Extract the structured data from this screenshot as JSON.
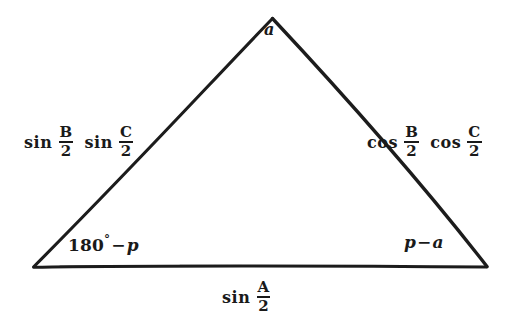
{
  "figure": {
    "type": "geometric-diagram",
    "shape": "triangle",
    "background_color": "#ffffff",
    "stroke_color": "#1a1a1a",
    "vertices": {
      "apex": {
        "x": 272,
        "y": 18
      },
      "bottom_left": {
        "x": 33,
        "y": 267
      },
      "bottom_right": {
        "x": 487,
        "y": 267
      }
    }
  },
  "labels": {
    "apex": {
      "text": "a",
      "style": "italic"
    },
    "left_side": {
      "function_1": "sin",
      "fraction_1": {
        "numerator": "B",
        "denominator": "2"
      },
      "function_2": "sin",
      "fraction_2": {
        "numerator": "C",
        "denominator": "2"
      }
    },
    "right_side": {
      "function_1": "cos",
      "fraction_1": {
        "numerator": "B",
        "denominator": "2"
      },
      "function_2": "cos",
      "fraction_2": {
        "numerator": "C",
        "denominator": "2"
      }
    },
    "base_side": {
      "function_1": "sin",
      "fraction_1": {
        "numerator": "A",
        "denominator": "2"
      }
    },
    "angle_bottom_left": {
      "value": "180",
      "degree_symbol": "°",
      "operator": "−",
      "variable": "p"
    },
    "angle_bottom_right": {
      "variable_1": "p",
      "operator": "−",
      "variable_2": "a"
    }
  }
}
